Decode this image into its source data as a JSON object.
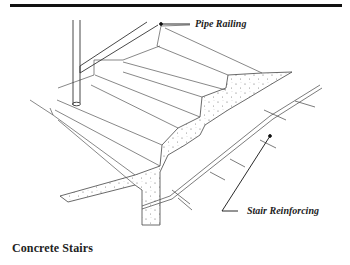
{
  "figure": {
    "caption": "Concrete Stairs",
    "labels": {
      "pipe_railing": "Pipe Railing",
      "stair_reinforcing": "Stair Reinforcing"
    },
    "colors": {
      "line": "#333333",
      "rule": "#111111",
      "concrete_dots": "#666666"
    }
  }
}
